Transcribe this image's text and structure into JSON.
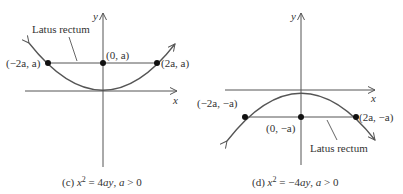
{
  "panels": [
    {
      "id": "c",
      "caption_prefix": "(c) ",
      "caption_var": "x",
      "caption_exp": "2",
      "caption_eq": " = 4",
      "caption_rhs": "ay",
      "caption_cond_sep": ", ",
      "caption_cond_var": "a",
      "caption_cond": " > 0",
      "axis_x_label": "x",
      "axis_y_label": "y",
      "latus_label": "Latus rectum",
      "points": {
        "left": "(−2a, a)",
        "center": "(0, a)",
        "right": "(2a, a)"
      },
      "equation": "x^2 = 4ay, a > 0",
      "opens": "up"
    },
    {
      "id": "d",
      "caption_prefix": "(d) ",
      "caption_var": "x",
      "caption_exp": "2",
      "caption_eq": " = −4",
      "caption_rhs": "ay",
      "caption_cond_sep": ", ",
      "caption_cond_var": "a",
      "caption_cond": " > 0",
      "axis_x_label": "x",
      "axis_y_label": "y",
      "latus_label": "Latus rectum",
      "points": {
        "left": "(−2a, −a)",
        "center": "(0, −a)",
        "right": "(2a, −a)"
      },
      "equation": "x^2 = −4ay, a > 0",
      "opens": "down"
    }
  ],
  "colors": {
    "line": "#555555",
    "dot": "#111111",
    "text": "#333333"
  }
}
